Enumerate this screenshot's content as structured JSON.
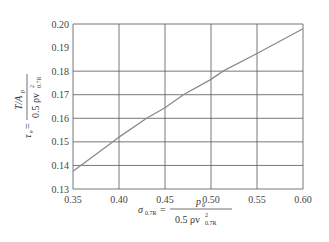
{
  "chart_data": {
    "type": "line",
    "title": "",
    "xlabel": "σ_0.7R = p_0 / (0.5 ρ v²_0.7R)",
    "ylabel": "τ_e = (T/A_p) / (0.5 ρ v²_0.7R)",
    "xlim": [
      0.35,
      0.6
    ],
    "ylim": [
      0.13,
      0.2
    ],
    "x_ticks": [
      "0.35",
      "0.40",
      "0.45",
      "0.50",
      "0.55",
      "0.60"
    ],
    "y_ticks": [
      "0.13",
      "0.14",
      "0.15",
      "0.16",
      "0.17",
      "0.18",
      "0.19",
      "0.20"
    ],
    "y_gridlines": [
      0.13,
      0.14,
      0.15,
      0.16,
      0.17,
      0.18,
      0.2
    ],
    "x_gridlines": [
      0.35,
      0.4,
      0.45,
      0.5,
      0.55,
      0.6
    ],
    "grid": true,
    "legend": null,
    "series": [
      {
        "name": "τ_e vs σ_0.7R",
        "color": "#8a8a8a",
        "x": [
          0.35,
          0.393,
          0.4,
          0.43,
          0.45,
          0.47,
          0.5,
          0.513,
          0.55,
          0.6
        ],
        "y": [
          0.1375,
          0.15,
          0.152,
          0.16,
          0.1645,
          0.17,
          0.1765,
          0.18,
          0.1875,
          0.198
        ]
      }
    ]
  },
  "labels": {
    "y_tau": "τ",
    "y_tau_sub": "e",
    "y_eq": "=",
    "y_num": "T/A",
    "y_num_sub": "p",
    "y_den": "0.5 ρv",
    "y_den_sup": "2",
    "y_den_sub": "0.7R",
    "x_sigma": "σ",
    "x_sigma_sub": "0.7R",
    "x_eq": "=",
    "x_num": "p",
    "x_num_sub": "0",
    "x_den": "0.5 ρv",
    "x_den_sup": "2",
    "x_den_sub": "0.7R"
  }
}
